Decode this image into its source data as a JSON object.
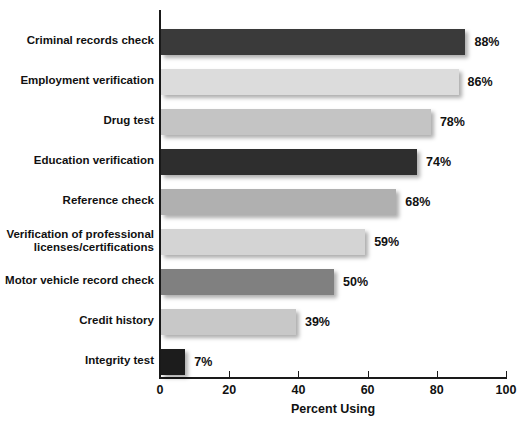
{
  "chart_data": {
    "type": "bar",
    "orientation": "horizontal",
    "title": "",
    "xlabel": "Percent Using",
    "ylabel": "",
    "xlim": [
      0,
      100
    ],
    "xticks": [
      0,
      20,
      40,
      60,
      80,
      100
    ],
    "xtick_labels": [
      "0",
      "20",
      "40",
      "60",
      "80",
      "100"
    ],
    "grid": false,
    "legend": false,
    "categories": [
      "Criminal records check",
      "Employment verification",
      "Drug test",
      "Education verification",
      "Reference check",
      "Verification of professional\nlicenses/certifications",
      "Motor vehicle record check",
      "Credit history",
      "Integrity test"
    ],
    "values": [
      88,
      86,
      78,
      74,
      68,
      59,
      50,
      39,
      7
    ],
    "value_labels": [
      "88%",
      "86%",
      "78%",
      "74%",
      "68%",
      "59%",
      "50%",
      "39%",
      "7%"
    ],
    "bar_colors": [
      "#3a3a3a",
      "#dcdcdc",
      "#c4c4c4",
      "#2e2e2e",
      "#b0b0b0",
      "#d4d4d4",
      "#808080",
      "#c8c8c8",
      "#1c1c1c"
    ]
  },
  "axis": {
    "x_title": "Percent Using",
    "ticks": [
      {
        "label": "0",
        "value": 0
      },
      {
        "label": "20",
        "value": 20
      },
      {
        "label": "40",
        "value": 40
      },
      {
        "label": "60",
        "value": 60
      },
      {
        "label": "80",
        "value": 80
      },
      {
        "label": "100",
        "value": 100
      }
    ]
  }
}
